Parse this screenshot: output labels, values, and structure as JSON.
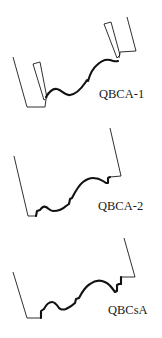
{
  "figure": {
    "panels": [
      {
        "id": "qbca-1",
        "label": "QBCA-1"
      },
      {
        "id": "qbca-2",
        "label": "QBCA-2"
      },
      {
        "id": "qbcsa",
        "label": "QBCsA"
      }
    ],
    "colors": {
      "line": "#1a1a1a",
      "background": "#ffffff"
    }
  }
}
